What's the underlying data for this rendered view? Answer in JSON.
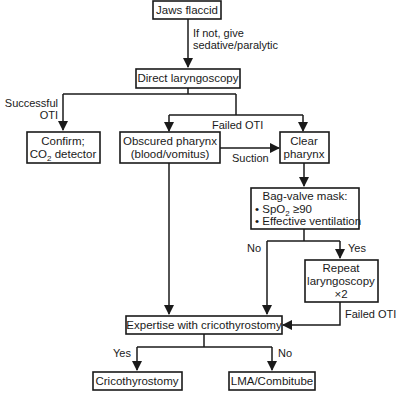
{
  "nodes": {
    "jaws_flaccid": "Jaws flaccid",
    "direct_laryngoscopy": "Direct laryngoscopy",
    "confirm": {
      "line1": "Confirm;",
      "line2_prefix": "CO",
      "line2_sub": "2",
      "line2_suffix": " detector"
    },
    "obscured_pharynx": {
      "line1": "Obscured pharynx",
      "line2": "(blood/vomitus)"
    },
    "clear_pharynx": {
      "line1": "Clear",
      "line2": "pharynx"
    },
    "bag_valve_mask": {
      "title": "Bag-valve mask:",
      "bullet1_prefix": "• SpO",
      "bullet1_sub": "2",
      "bullet1_suffix": " ≥90",
      "bullet2": "• Effective ventilation"
    },
    "repeat_laryngoscopy": {
      "line1": "Repeat",
      "line2": "laryngoscopy",
      "line3": "×2"
    },
    "expertise": "Expertise with cricothyrostomy",
    "cricothyrostomy": "Cricothyrostomy",
    "lma": "LMA/Combitube"
  },
  "edges": {
    "if_not": {
      "line1": "If not, give",
      "line2": "sedative/paralytic"
    },
    "successful_oti": {
      "line1": "Successful",
      "line2": "OTI"
    },
    "failed_oti_top": "Failed OTI",
    "suction": "Suction",
    "no_bvm": "No",
    "yes_bvm": "Yes",
    "failed_oti_repeat": "Failed OTI",
    "yes_expertise": "Yes",
    "no_expertise": "No"
  }
}
